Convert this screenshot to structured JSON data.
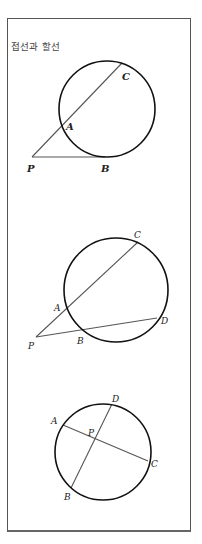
{
  "title": "접선과 할선",
  "diagrams": [
    {
      "name": "tangent-secant",
      "circle": {
        "cx": 107,
        "cy": 109,
        "r": 48
      },
      "segments": [
        {
          "from": "P",
          "to": "C"
        },
        {
          "from": "P",
          "to": "B"
        }
      ],
      "points": {
        "P": {
          "x": 32,
          "y": 157,
          "label": "P",
          "lx": 27,
          "ly": 172
        },
        "A": {
          "x": 62,
          "y": 124,
          "label": "A",
          "lx": 66,
          "ly": 130
        },
        "C": {
          "x": 122,
          "y": 63,
          "label": "C",
          "lx": 122,
          "ly": 80
        },
        "B": {
          "x": 105,
          "y": 157,
          "label": "B",
          "lx": 101,
          "ly": 172
        }
      }
    },
    {
      "name": "two-secants",
      "circle": {
        "cx": 116,
        "cy": 290,
        "r": 52
      },
      "segments": [
        {
          "from": "P",
          "to": "C"
        },
        {
          "from": "P",
          "to": "D"
        }
      ],
      "points": {
        "P": {
          "x": 36,
          "y": 337,
          "label": "P",
          "lx": 28,
          "ly": 349
        },
        "A": {
          "x": 66,
          "y": 306,
          "label": "A",
          "lx": 54,
          "ly": 311
        },
        "C": {
          "x": 138,
          "y": 242,
          "label": "C",
          "lx": 134,
          "ly": 238
        },
        "B": {
          "x": 82,
          "y": 329,
          "label": "B",
          "lx": 77,
          "ly": 344
        },
        "D": {
          "x": 157,
          "y": 318,
          "label": "D",
          "lx": 161,
          "ly": 324
        }
      }
    },
    {
      "name": "intersecting-chords",
      "circle": {
        "cx": 103,
        "cy": 452,
        "r": 48
      },
      "segments": [
        {
          "from": "A",
          "to": "C"
        },
        {
          "from": "D",
          "to": "B"
        }
      ],
      "points": {
        "A": {
          "x": 63,
          "y": 425,
          "label": "A",
          "lx": 51,
          "ly": 424
        },
        "C": {
          "x": 148,
          "y": 461,
          "label": "C",
          "lx": 151,
          "ly": 467
        },
        "D": {
          "x": 112,
          "y": 404,
          "label": "D",
          "lx": 112,
          "ly": 402
        },
        "B": {
          "x": 71,
          "y": 488,
          "label": "B",
          "lx": 64,
          "ly": 500
        },
        "P": {
          "x": 95,
          "y": 439,
          "label": "P",
          "lx": 88,
          "ly": 436
        }
      }
    }
  ]
}
